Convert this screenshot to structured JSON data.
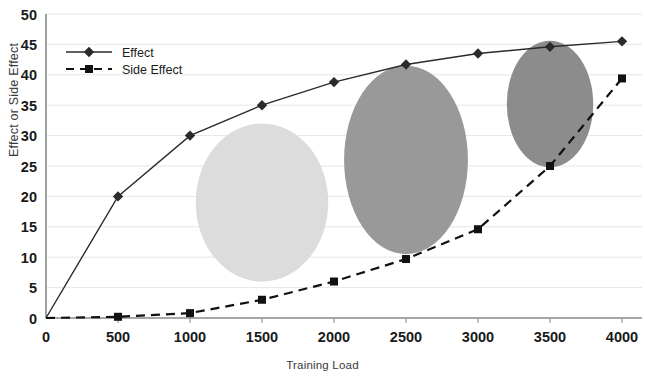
{
  "chart_data": {
    "type": "line",
    "title": "",
    "xlabel": "Training Load",
    "ylabel": "Effect or Side Effect",
    "x": [
      0,
      500,
      1000,
      1500,
      2000,
      2500,
      3000,
      3500,
      4000
    ],
    "xlim": [
      0,
      4000
    ],
    "ylim": [
      0,
      50
    ],
    "xticks": [
      "0",
      "500",
      "1000",
      "1500",
      "2000",
      "2500",
      "3000",
      "3500",
      "4000"
    ],
    "yticks": [
      "0",
      "5",
      "10",
      "15",
      "20",
      "25",
      "30",
      "35",
      "40",
      "45",
      "50"
    ],
    "grid": "horizontal",
    "legend_position": "top-left",
    "series": [
      {
        "name": "Effect",
        "marker": "diamond",
        "linestyle": "solid",
        "color": "#2b2b2b",
        "values": [
          0,
          20,
          30,
          35,
          38.8,
          41.7,
          43.5,
          44.6,
          45.5
        ]
      },
      {
        "name": "Side Effect",
        "marker": "square",
        "linestyle": "dashed",
        "color": "#111111",
        "values": [
          0,
          0.2,
          0.8,
          3,
          6,
          9.7,
          14.6,
          25,
          39.4
        ]
      }
    ],
    "annotations": [
      {
        "id": "zone-light",
        "shape": "ellipse",
        "cx": 1500,
        "cy": 19,
        "rx": 460,
        "ry": 13.0,
        "fill": "#dcdcdc",
        "label": ""
      },
      {
        "id": "zone-medium",
        "shape": "ellipse",
        "cx": 2500,
        "cy": 26,
        "rx": 430,
        "ry": 15.5,
        "fill": "#999999",
        "label": ""
      },
      {
        "id": "zone-dark",
        "shape": "ellipse",
        "cx": 3500,
        "cy": 35.2,
        "rx": 300,
        "ry": 10.4,
        "fill": "#8c8c8c",
        "label": ""
      }
    ]
  },
  "axes": {
    "axis_color": "#8a8a8a",
    "grid_color": "#e6e6e6"
  }
}
